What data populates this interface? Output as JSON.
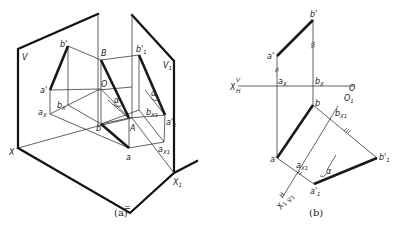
{
  "figure_a": {
    "caption": "(a)",
    "planes": {
      "v": "V",
      "v1": "V",
      "v1_sub": "1"
    },
    "axes": {
      "x": "X",
      "x1": "X",
      "x1_sub": "1"
    },
    "points": {
      "b_prime": "b'",
      "a_prime": "a'",
      "B": "B",
      "O": "O",
      "bx": "b",
      "bx_sub": "X",
      "ax": "a",
      "ax_sub": "X",
      "b": "b",
      "A": "A",
      "a": "a",
      "b1_prime": "b'",
      "b1_sub": "1",
      "a1_prime": "a'",
      "a1_sub": "1",
      "bx1": "b",
      "bx1_sub": "X1",
      "ax1": "a",
      "ax1_sub": "X1",
      "alpha1": "α",
      "alpha2": "α",
      "equal_mark": "="
    }
  },
  "figure_b": {
    "caption": "(b)",
    "axis_x": {
      "x": "X",
      "v": "V",
      "h": "H"
    },
    "axis_x1": {
      "x1": "X",
      "x1_sub": "1",
      "h": "H",
      "v1": "V",
      "v1_sub": "1"
    },
    "points": {
      "b_prime": "b'",
      "a_prime": "a'",
      "ax": "a",
      "ax_sub": "X",
      "bx": "b",
      "bx_sub": "X",
      "O": "O",
      "O1": "O",
      "O1_sub": "1",
      "b": "b",
      "a": "a",
      "bx1": "b",
      "bx1_sub": "X1",
      "ax1": "a",
      "ax1_sub": "X1",
      "b1_prime": "b'",
      "b1_sub": "1",
      "a1_prime": "a'",
      "a1_sub": "1",
      "alpha": "α"
    }
  }
}
